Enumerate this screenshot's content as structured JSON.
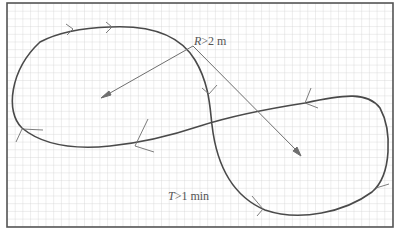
{
  "diagram": {
    "type": "figure-eight path on grid paper",
    "labels": {
      "radius_var": "R",
      "radius_rest": ">2 m",
      "time_var": "T",
      "time_rest": ">1 min"
    },
    "colors": {
      "grid": "#c8c8c8",
      "border": "#555555",
      "path": "#4a4a4a",
      "leader": "#6e6e6e",
      "text": "#555555"
    },
    "grid": {
      "cell_px": 7.7,
      "visible": true
    },
    "direction_arrows": 10,
    "leader_lines": [
      {
        "from": "R>2 m label",
        "to": "left loop center"
      },
      {
        "from": "R>2 m label",
        "to": "right loop center"
      }
    ]
  }
}
